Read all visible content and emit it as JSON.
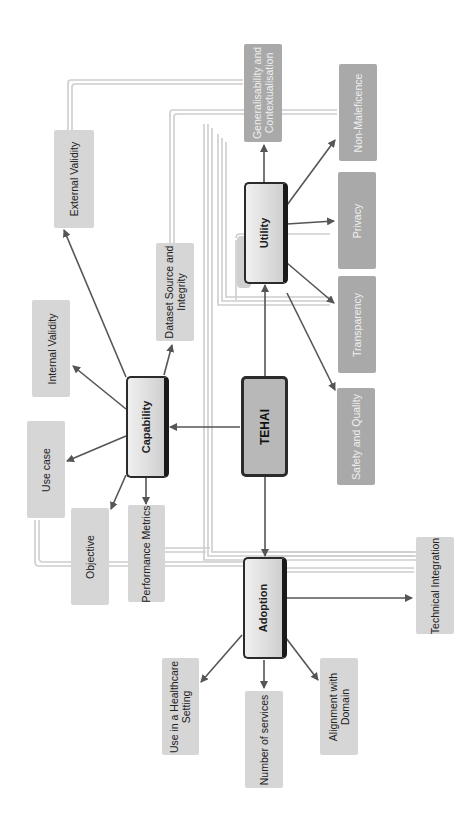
{
  "diagram": {
    "orientation": "rotated 90deg counter-clockwise",
    "center": {
      "label": "TEHAI"
    },
    "components": {
      "capability": {
        "label": "Capability",
        "children": [
          "Objective",
          "Use case",
          "Internal Validity",
          "External Validity",
          "Dataset Source and Integrity",
          "Performance Metrics"
        ]
      },
      "utility": {
        "label": "Utility",
        "children": [
          "Generalisability and Contextualisation",
          "Non-Maleficence",
          "Privacy",
          "Transparency",
          "Safety and Quality"
        ]
      },
      "adoption": {
        "label": "Adoption",
        "children": [
          "Use in a Healthcare Setting",
          "Number of services",
          "Alignment with Domain",
          "Technical Integration"
        ]
      }
    },
    "labels": {
      "tehai": "TEHAI",
      "capability": "Capability",
      "utility": "Utility",
      "adoption": "Adoption",
      "external_validity": "External Validity",
      "internal_validity": "Internal Validity",
      "use_case": "Use case",
      "objective": "Objective",
      "performance_metrics": "Performance Metrics",
      "dataset_source_1": "Dataset Source and",
      "dataset_source_2": "Integrity",
      "generalisability_1": "Generalisability and",
      "generalisability_2": "Contextualisation",
      "non_maleficence": "Non-Maleficence",
      "privacy": "Privacy",
      "transparency": "Transparency",
      "safety_quality": "Safety and Quality",
      "technical_integration": "Technical Integration",
      "use_healthcare_1": "Use in a Healthcare",
      "use_healthcare_2": "Setting",
      "number_services": "Number of services",
      "alignment_1": "Alignment with",
      "alignment_2": "Domain"
    },
    "colors": {
      "arrow": "#555555",
      "connector": "#cccccc",
      "sub_box_light": "#d6d6d6",
      "sub_box_dark": "#a9a9a9",
      "main_border": "#2b2b2b",
      "tehai_fill": "#b8b8b8"
    }
  }
}
